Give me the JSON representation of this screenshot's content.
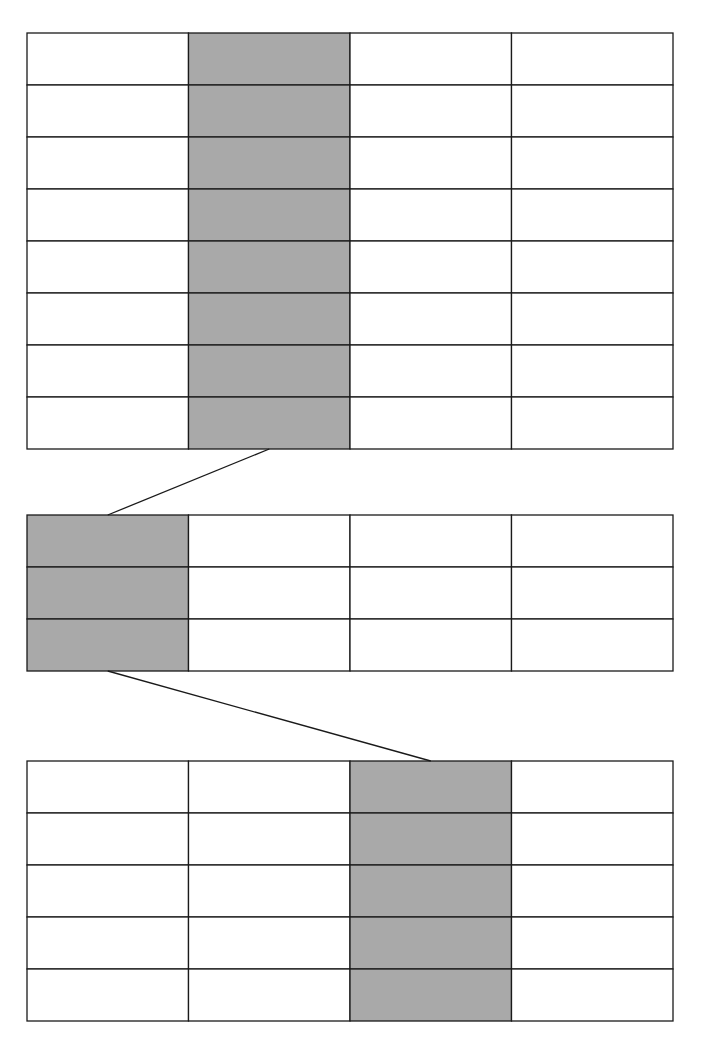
{
  "diagram": {
    "colors": {
      "line": "#1a1a1a",
      "shade": "#a9a9a9",
      "cell": "#ffffff"
    },
    "grids": [
      {
        "name": "grid-top",
        "rows": 8,
        "cols": 4,
        "shaded_cols": [
          1
        ],
        "shaded_rows": []
      },
      {
        "name": "grid-middle",
        "rows": 3,
        "cols": 4,
        "shaded_cols": [
          0
        ],
        "shaded_rows": []
      },
      {
        "name": "grid-bottom",
        "rows": 5,
        "cols": 4,
        "shaded_cols": [
          2
        ],
        "shaded_rows": []
      }
    ],
    "connectors": [
      {
        "name": "connector-top-to-middle",
        "from_grid": 0,
        "from_col": 1,
        "to_grid": 1,
        "to_col": 0
      },
      {
        "name": "connector-middle-to-bottom",
        "from_grid": 1,
        "from_col": 0,
        "to_grid": 2,
        "to_col": 2
      }
    ]
  }
}
